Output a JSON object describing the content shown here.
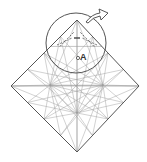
{
  "diagram": {
    "type": "origami-crease-pattern",
    "colors": {
      "background": "#ffffff",
      "outline": "#555555",
      "crease": "#9a9a9a",
      "valley": "#444444",
      "circle": "#555555",
      "arrow": "#444444"
    },
    "square": {
      "top": [
        77,
        20
      ],
      "right": [
        139,
        86
      ],
      "bottom": [
        77,
        152
      ],
      "left": [
        11,
        86
      ]
    },
    "centers": [
      {
        "id": "left-star",
        "x": 50,
        "y": 85
      },
      {
        "id": "right-star",
        "x": 103,
        "y": 85
      },
      {
        "id": "bottom-star",
        "x": 77,
        "y": 113
      }
    ],
    "magnify_circle": {
      "cx": 76,
      "cy": 43,
      "r": 30
    },
    "point_a": {
      "x": 78,
      "y": 58,
      "label": "A"
    },
    "arrow": {
      "description": "outline arrow indicating turn over / rotate",
      "direction": "up-right"
    }
  }
}
